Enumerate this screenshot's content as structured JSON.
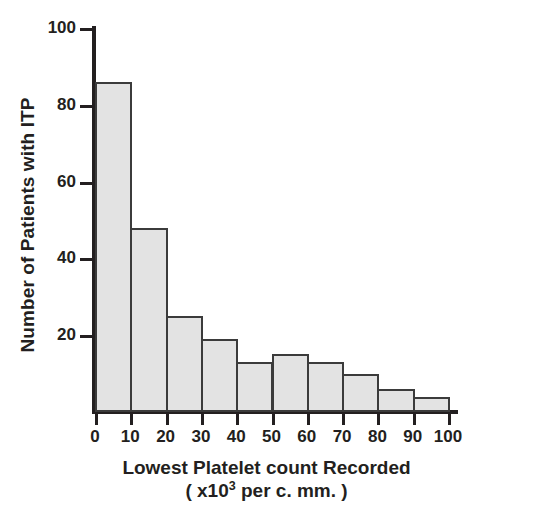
{
  "chart_data": {
    "type": "bar",
    "title": "",
    "xlabel": "Lowest Platelet count Recorded",
    "xlabel_units_prefix": "( x10",
    "xlabel_units_exponent": "3",
    "xlabel_units_suffix": " per c. mm. )",
    "ylabel": "Number of Patients with ITP",
    "bin_edges": [
      0,
      10,
      20,
      30,
      40,
      50,
      60,
      70,
      80,
      90,
      100
    ],
    "categories": [
      "0-10",
      "10-20",
      "20-30",
      "30-40",
      "40-50",
      "50-60",
      "60-70",
      "70-80",
      "80-90",
      "90-100"
    ],
    "values": [
      86,
      48,
      25,
      19,
      13,
      15,
      13,
      10,
      6,
      4
    ],
    "x_tick_labels": [
      "0",
      "10",
      "20",
      "30",
      "40",
      "50",
      "60",
      "70",
      "80",
      "90",
      "100"
    ],
    "x_tick_values": [
      0,
      10,
      20,
      30,
      40,
      50,
      60,
      70,
      80,
      90,
      100
    ],
    "y_tick_labels": [
      "100",
      "80",
      "60",
      "40",
      "20"
    ],
    "y_tick_values": [
      100,
      80,
      60,
      40,
      20
    ],
    "xlim": [
      0,
      100
    ],
    "ylim": [
      0,
      100
    ],
    "grid": false,
    "legend": false,
    "bar_fill_color": "#e3e3e3",
    "bar_edge_color": "#3b3b3b",
    "axis_color": "#231f20",
    "background_color": "#ffffff"
  }
}
